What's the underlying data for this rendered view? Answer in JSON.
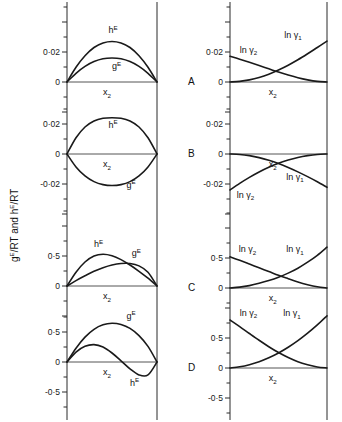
{
  "figure": {
    "y_axis_label_parts": [
      "g",
      "E",
      "/RT  and  h",
      "E",
      "/RT"
    ],
    "y_axis_label_text": "g E/RT and h E/RT",
    "panels": [
      {
        "letter": "A",
        "left": {
          "ytick_labels": [
            "0·02",
            "0"
          ],
          "xlabel": "x",
          "xlabel_sub": "2",
          "curves": [
            {
              "name": "h",
              "sup": "E",
              "label": "hE"
            },
            {
              "name": "g",
              "sup": "E",
              "label": "gE"
            }
          ]
        },
        "right": {
          "ytick_labels": [
            "0·02",
            "0"
          ],
          "xlabel": "x",
          "xlabel_sub": "2",
          "curves": [
            {
              "name": "ln γ",
              "sub": "2",
              "label": "ln γ2"
            },
            {
              "name": "ln γ",
              "sub": "1",
              "label": "ln γ1"
            }
          ]
        }
      },
      {
        "letter": "B",
        "left": {
          "ytick_labels": [
            "0·02",
            "0",
            "-0·02"
          ],
          "xlabel": "x",
          "xlabel_sub": "2",
          "curves": [
            {
              "name": "h",
              "sup": "E",
              "label": "hE"
            },
            {
              "name": "g",
              "sup": "E",
              "label": "gE"
            }
          ]
        },
        "right": {
          "ytick_labels": [
            "0·02",
            "0",
            "-0·02"
          ],
          "xlabel": "x",
          "xlabel_sub": "2",
          "curves": [
            {
              "name": "ln γ",
              "sub": "2",
              "label": "ln γ2"
            },
            {
              "name": "ln γ",
              "sub": "1",
              "label": "ln γ1"
            }
          ]
        }
      },
      {
        "letter": "C",
        "left": {
          "ytick_labels": [
            "0·5",
            "0"
          ],
          "xlabel": "x",
          "xlabel_sub": "2",
          "curves": [
            {
              "name": "h",
              "sup": "E",
              "label": "hE"
            },
            {
              "name": "g",
              "sup": "E",
              "label": "gE"
            }
          ]
        },
        "right": {
          "ytick_labels": [
            "0·5",
            "0"
          ],
          "xlabel": "x",
          "xlabel_sub": "2",
          "curves": [
            {
              "name": "ln γ",
              "sub": "2",
              "label": "ln γ2"
            },
            {
              "name": "ln γ",
              "sub": "1",
              "label": "ln γ1"
            }
          ]
        }
      },
      {
        "letter": "D",
        "left": {
          "ytick_labels": [
            "0·5",
            "0",
            "-0·5"
          ],
          "xlabel": "x",
          "xlabel_sub": "2",
          "curves": [
            {
              "name": "g",
              "sup": "E",
              "label": "gE"
            },
            {
              "name": "h",
              "sup": "E",
              "label": "hE"
            }
          ]
        },
        "right": {
          "ytick_labels": [
            "0·5",
            "0",
            "-0·5"
          ],
          "xlabel": "x",
          "xlabel_sub": "2",
          "curves": [
            {
              "name": "ln γ",
              "sub": "2",
              "label": "ln γ2"
            },
            {
              "name": "ln γ",
              "sub": "1",
              "label": "ln γ1"
            }
          ]
        }
      }
    ]
  },
  "chart_data": {
    "type": "line",
    "title": "",
    "xlabel": "x2",
    "ylabel": "gE/RT and hE/RT",
    "grid": false,
    "legend": "inline-annotations",
    "panels": [
      {
        "letter": "A",
        "left": {
          "ylim": [
            -0.02,
            0.04
          ],
          "yticks": [
            0,
            0.02
          ],
          "ytick_labels": [
            "0",
            "0·02"
          ],
          "x": [
            0,
            0.1,
            0.2,
            0.3,
            0.4,
            0.5,
            0.6,
            0.7,
            0.8,
            0.9,
            1.0
          ],
          "series": [
            {
              "name": "hE",
              "values": [
                0,
                0.0098,
                0.0175,
                0.023,
                0.026,
                0.027,
                0.026,
                0.023,
                0.0175,
                0.0098,
                0
              ]
            },
            {
              "name": "gE",
              "values": [
                0,
                0.0058,
                0.0104,
                0.0136,
                0.0155,
                0.016,
                0.0155,
                0.0136,
                0.0104,
                0.0058,
                0
              ]
            }
          ]
        },
        "right": {
          "ylim": [
            -0.02,
            0.035
          ],
          "yticks": [
            0,
            0.02
          ],
          "ytick_labels": [
            "0",
            "0·02"
          ],
          "x": [
            0,
            0.1,
            0.2,
            0.3,
            0.4,
            0.5,
            0.6,
            0.7,
            0.8,
            0.9,
            1.0
          ],
          "series": [
            {
              "name": "ln γ2",
              "values": [
                0.0172,
                0.0152,
                0.0131,
                0.011,
                0.0088,
                0.0066,
                0.0046,
                0.0028,
                0.0014,
                0.0004,
                0
              ]
            },
            {
              "name": "ln γ1",
              "values": [
                0,
                0.0004,
                0.0014,
                0.003,
                0.0052,
                0.008,
                0.0112,
                0.0148,
                0.0188,
                0.023,
                0.0272
              ]
            }
          ]
        }
      },
      {
        "letter": "B",
        "left": {
          "ylim": [
            -0.035,
            0.035
          ],
          "yticks": [
            -0.02,
            0,
            0.02
          ],
          "ytick_labels": [
            "-0·02",
            "0",
            "0·02"
          ],
          "x": [
            0,
            0.1,
            0.2,
            0.3,
            0.4,
            0.5,
            0.6,
            0.7,
            0.8,
            0.9,
            1.0
          ],
          "series": [
            {
              "name": "hE",
              "values": [
                0,
                0.0108,
                0.018,
                0.022,
                0.0238,
                0.0242,
                0.0238,
                0.022,
                0.018,
                0.0108,
                0
              ]
            },
            {
              "name": "gE",
              "values": [
                0,
                -0.0086,
                -0.0146,
                -0.0184,
                -0.0204,
                -0.021,
                -0.0204,
                -0.0184,
                -0.0146,
                -0.0086,
                0
              ]
            }
          ]
        },
        "right": {
          "ylim": [
            -0.032,
            0.032
          ],
          "yticks": [
            -0.02,
            0,
            0.02
          ],
          "ytick_labels": [
            "-0·02",
            "0",
            "0·02"
          ],
          "x": [
            0,
            0.1,
            0.2,
            0.3,
            0.4,
            0.5,
            0.6,
            0.7,
            0.8,
            0.9,
            1.0
          ],
          "series": [
            {
              "name": "ln γ2",
              "values": [
                -0.024,
                -0.0196,
                -0.0156,
                -0.012,
                -0.0089,
                -0.0062,
                -0.004,
                -0.0023,
                -0.0011,
                -0.0003,
                0
              ]
            },
            {
              "name": "ln γ1",
              "values": [
                0,
                -0.0003,
                -0.0011,
                -0.0024,
                -0.0042,
                -0.0064,
                -0.009,
                -0.0119,
                -0.0151,
                -0.0185,
                -0.0222
              ]
            }
          ]
        }
      },
      {
        "letter": "C",
        "left": {
          "ylim": [
            -0.25,
            0.85
          ],
          "yticks": [
            0,
            0.5
          ],
          "ytick_labels": [
            "0",
            "0·5"
          ],
          "x": [
            0,
            0.1,
            0.2,
            0.3,
            0.4,
            0.5,
            0.6,
            0.7,
            0.8,
            0.9,
            1.0
          ],
          "series": [
            {
              "name": "hE",
              "values": [
                0,
                0.23,
                0.4,
                0.5,
                0.53,
                0.505,
                0.44,
                0.35,
                0.245,
                0.13,
                0
              ]
            },
            {
              "name": "gE",
              "values": [
                0,
                0.09,
                0.17,
                0.245,
                0.305,
                0.35,
                0.375,
                0.375,
                0.335,
                0.23,
                0
              ]
            }
          ]
        },
        "right": {
          "ylim": [
            -0.2,
            0.85
          ],
          "yticks": [
            0,
            0.5
          ],
          "ytick_labels": [
            "0",
            "0·5"
          ],
          "x": [
            0,
            0.1,
            0.2,
            0.3,
            0.4,
            0.5,
            0.6,
            0.7,
            0.8,
            0.9,
            1.0
          ],
          "series": [
            {
              "name": "ln γ2",
              "values": [
                0.52,
                0.462,
                0.4,
                0.337,
                0.275,
                0.212,
                0.155,
                0.1,
                0.055,
                0.02,
                0
              ]
            },
            {
              "name": "ln γ1",
              "values": [
                0,
                0.014,
                0.04,
                0.078,
                0.124,
                0.18,
                0.248,
                0.33,
                0.43,
                0.545,
                0.68
              ]
            }
          ]
        }
      },
      {
        "letter": "D",
        "left": {
          "ylim": [
            -0.75,
            0.85
          ],
          "yticks": [
            -0.5,
            0,
            0.5
          ],
          "ytick_labels": [
            "-0·5",
            "0",
            "0·5"
          ],
          "x": [
            0,
            0.1,
            0.2,
            0.3,
            0.4,
            0.5,
            0.6,
            0.7,
            0.8,
            0.9,
            1.0
          ],
          "series": [
            {
              "name": "gE",
              "values": [
                0,
                0.23,
                0.415,
                0.545,
                0.62,
                0.645,
                0.625,
                0.56,
                0.44,
                0.26,
                0
              ]
            },
            {
              "name": "hE",
              "values": [
                0,
                0.165,
                0.262,
                0.29,
                0.25,
                0.15,
                0.02,
                -0.115,
                -0.215,
                -0.215,
                0
              ]
            }
          ]
        },
        "right": {
          "ylim": [
            -0.75,
            0.95
          ],
          "yticks": [
            -0.5,
            0,
            0.5
          ],
          "ytick_labels": [
            "-0·5",
            "0",
            "0·5"
          ],
          "x": [
            0,
            0.1,
            0.2,
            0.3,
            0.4,
            0.5,
            0.6,
            0.7,
            0.8,
            0.9,
            1.0
          ],
          "series": [
            {
              "name": "ln γ2",
              "values": [
                0.8,
                0.69,
                0.575,
                0.462,
                0.355,
                0.258,
                0.175,
                0.105,
                0.055,
                0.018,
                0
              ]
            },
            {
              "name": "ln γ1",
              "values": [
                0,
                0.02,
                0.055,
                0.105,
                0.17,
                0.25,
                0.345,
                0.455,
                0.58,
                0.718,
                0.87
              ]
            }
          ]
        }
      }
    ]
  }
}
